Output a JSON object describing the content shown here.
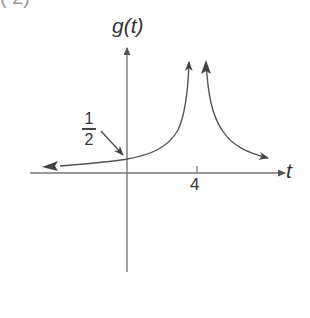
{
  "figure": {
    "corner_fragment": "( 2)",
    "y_axis_label": "g(t)",
    "x_axis_label": "t",
    "x_tick_label": "4",
    "annotation": {
      "numerator": "1",
      "denominator": "2",
      "meaning": "y-intercept value 1/2"
    },
    "colors": {
      "line": "#555555",
      "text": "#333333",
      "background": "#ffffff"
    }
  }
}
